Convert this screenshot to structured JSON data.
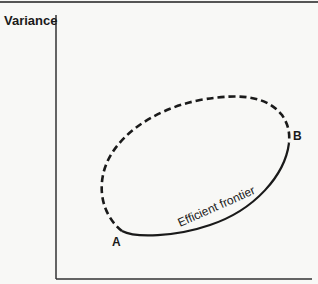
{
  "diagram": {
    "y_axis_label": "Variance",
    "point_a_label": "A",
    "point_b_label": "B",
    "curve_label": "Efficient frontier",
    "colors": {
      "line": "#1a1a1a",
      "frame": "#444444",
      "background": "#f8f8f6"
    }
  }
}
